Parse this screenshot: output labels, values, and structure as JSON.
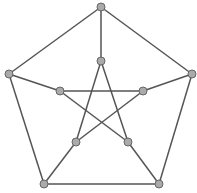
{
  "diagram": {
    "colors": {
      "edge": "#555555",
      "node_fill": "#aaaaaa",
      "node_stroke": "#666666",
      "background": "#ffffff"
    },
    "nodes": [
      {
        "id": "o0",
        "x": 101,
        "y": 7
      },
      {
        "id": "o1",
        "x": 192,
        "y": 74
      },
      {
        "id": "o2",
        "x": 159,
        "y": 184
      },
      {
        "id": "o3",
        "x": 44,
        "y": 184
      },
      {
        "id": "o4",
        "x": 9,
        "y": 74
      },
      {
        "id": "i0",
        "x": 101,
        "y": 61
      },
      {
        "id": "i1",
        "x": 143,
        "y": 91
      },
      {
        "id": "i2",
        "x": 128,
        "y": 142
      },
      {
        "id": "i3",
        "x": 76,
        "y": 142
      },
      {
        "id": "i4",
        "x": 60,
        "y": 91
      }
    ],
    "edges": [
      [
        "o0",
        "o1"
      ],
      [
        "o1",
        "o2"
      ],
      [
        "o2",
        "o3"
      ],
      [
        "o3",
        "o4"
      ],
      [
        "o4",
        "o0"
      ],
      [
        "o0",
        "i0"
      ],
      [
        "o1",
        "i1"
      ],
      [
        "o2",
        "i2"
      ],
      [
        "o3",
        "i3"
      ],
      [
        "o4",
        "i4"
      ],
      [
        "i0",
        "i2"
      ],
      [
        "i2",
        "i4"
      ],
      [
        "i4",
        "i1"
      ],
      [
        "i1",
        "i3"
      ],
      [
        "i3",
        "i0"
      ]
    ]
  }
}
